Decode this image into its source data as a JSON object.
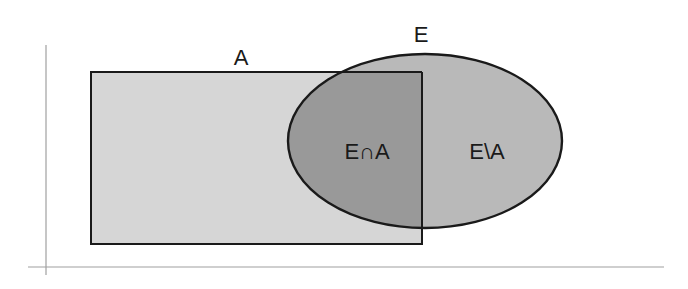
{
  "diagram": {
    "type": "venn",
    "sets": [
      {
        "id": "A",
        "label": "A",
        "shape": "rectangle"
      },
      {
        "id": "E",
        "label": "E",
        "shape": "ellipse"
      }
    ],
    "regions": [
      {
        "id": "intersection",
        "label": "E∩A"
      },
      {
        "id": "difference",
        "label": "E\\A"
      }
    ]
  },
  "colors": {
    "background": "#ffffff",
    "rect_fill": "#d6d6d6",
    "ellipse_fill": "#b9b9b9",
    "intersection_fill": "#999999",
    "stroke": "#1a1a1a",
    "axis": "#9a9a9a"
  }
}
